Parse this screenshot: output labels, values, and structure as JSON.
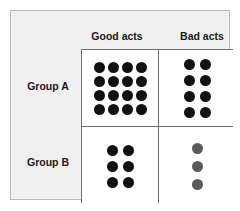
{
  "figure": {
    "panel_background": "#f0f0f0",
    "panel_border": "#b9b9b9"
  },
  "headers": {
    "column_good": "Good acts",
    "column_bad": "Bad acts",
    "row_a": "Group A",
    "row_b": "Group B"
  },
  "chart_data": {
    "type": "table",
    "title": "",
    "xlabel": "",
    "ylabel": "",
    "row_categories": [
      "Group A",
      "Group B"
    ],
    "column_categories": [
      "Good acts",
      "Bad acts"
    ],
    "cells": [
      {
        "row": "Group A",
        "column": "Good acts",
        "count": 16,
        "dot_rows": 4,
        "dot_cols": 4,
        "dot_color": "#111111"
      },
      {
        "row": "Group A",
        "column": "Bad acts",
        "count": 8,
        "dot_rows": 4,
        "dot_cols": 2,
        "dot_color": "#111111"
      },
      {
        "row": "Group B",
        "column": "Good acts",
        "count": 6,
        "dot_rows": 3,
        "dot_cols": 2,
        "dot_color": "#111111"
      },
      {
        "row": "Group B",
        "column": "Bad acts",
        "count": 3,
        "dot_rows": 3,
        "dot_cols": 1,
        "dot_color": "#5a5a5a"
      }
    ],
    "values": [
      [
        16,
        8
      ],
      [
        6,
        3
      ]
    ],
    "grid": true,
    "legend": "none"
  }
}
